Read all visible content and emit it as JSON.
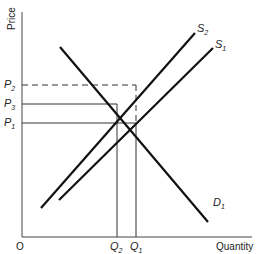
{
  "diagram": {
    "axes": {
      "y_label": "Price",
      "x_label": "Quantity",
      "origin_label": "O"
    },
    "curves": {
      "demand": {
        "name": "D",
        "sub": "1"
      },
      "supply_new": {
        "name": "S",
        "sub": "2"
      },
      "supply_old": {
        "name": "S",
        "sub": "1"
      }
    },
    "price_levels": [
      {
        "name": "P",
        "sub": "2",
        "style": "dashed"
      },
      {
        "name": "P",
        "sub": "3",
        "style": "solid"
      },
      {
        "name": "P",
        "sub": "1",
        "style": "solid"
      }
    ],
    "quantity_levels": [
      {
        "name": "Q",
        "sub": "2"
      },
      {
        "name": "Q",
        "sub": "1"
      }
    ],
    "colors": {
      "line": "#111111",
      "text": "#222222",
      "background": "#ffffff"
    }
  }
}
